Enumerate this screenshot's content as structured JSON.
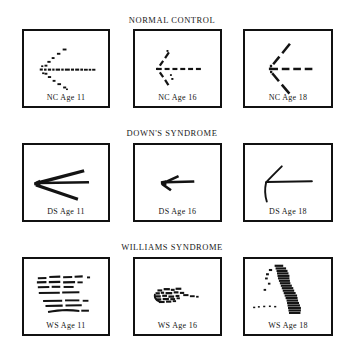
{
  "figure": {
    "background_color": "#ffffff",
    "ink_color": "#111111",
    "groups": [
      {
        "id": "normal-control",
        "title": "NORMAL CONTROL",
        "panels": [
          {
            "id": "nc-age-11",
            "label": "NC Age 11",
            "description": "arrow drawn as many small separate dots and short dashes; shaft horizontal, head a loose V of dots",
            "stroke_style": "dotted",
            "segments": 26
          },
          {
            "id": "nc-age-16",
            "label": "NC Age 16",
            "description": "arrow drawn with dashes; shaft a row of short dashes, head two dashed diagonal strokes",
            "stroke_style": "dashed",
            "segments": 16
          },
          {
            "id": "nc-age-18",
            "label": "NC Age 18",
            "description": "large arrow drawn with long dashes; wide open arrowhead",
            "stroke_style": "dashed",
            "segments": 13
          }
        ]
      },
      {
        "id": "downs-syndrome",
        "title": "DOWN'S SYNDROME",
        "panels": [
          {
            "id": "ds-age-11",
            "label": "DS Age 11",
            "description": "large continuous arrow with heavy tapering strokes, very wide arrowhead, no shaft line",
            "stroke_style": "continuous",
            "segments": 3
          },
          {
            "id": "ds-age-16",
            "label": "DS Age 16",
            "description": "small continuous arrow, short shaft with compact solid arrowhead",
            "stroke_style": "continuous",
            "segments": 3
          },
          {
            "id": "ds-age-18",
            "label": "DS Age 18",
            "description": "continuous arrow with long thin shaft and narrow hooked arrowhead",
            "stroke_style": "continuous",
            "segments": 3
          }
        ]
      },
      {
        "id": "williams-syndrome",
        "title": "WILLIAMS SYNDROME",
        "panels": [
          {
            "id": "ws-age-11",
            "label": "WS Age 11",
            "description": "disorganized horizontal dashes in five stacked rows, no arrow form",
            "stroke_style": "dashed",
            "segments": 22
          },
          {
            "id": "ws-age-16",
            "label": "WS Age 16",
            "description": "small dense cluster of scribbled marks with a short dashed tail to the right",
            "stroke_style": "scribble",
            "segments": 24
          },
          {
            "id": "ws-age-18",
            "label": "WS Age 18",
            "description": "vertical column of stacked horizontal dashes curving down to the right, scattered dots at left",
            "stroke_style": "dashed",
            "segments": 30
          }
        ]
      }
    ]
  }
}
